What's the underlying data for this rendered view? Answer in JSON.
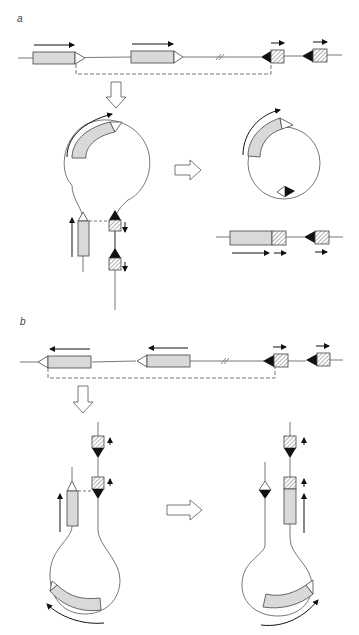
{
  "figure": {
    "panels": [
      {
        "label": "a",
        "description": "Deletion-type rearrangement: excision of intervening DNA as a circle",
        "genes": [
          "gene-segment-1",
          "gene-segment-2"
        ],
        "signal_elements": [
          "rss-element-1",
          "rss-element-2"
        ],
        "process_arrow": "down-arrow",
        "products": [
          "circular-excision-product",
          "recombined-linear-chromosome"
        ]
      },
      {
        "label": "b",
        "description": "Inversion-type rearrangement: intervening DNA inverted in chromosome",
        "genes": [
          "gene-segment-1",
          "gene-segment-2"
        ],
        "signal_elements": [
          "rss-element-1",
          "rss-element-2"
        ],
        "process_arrow": "down-arrow",
        "products": [
          "inverted-loop-product"
        ]
      }
    ],
    "colors": {
      "gene_fill": "#d9d9d9",
      "line": "#555555",
      "stroke": "#444444",
      "triangle_black": "#111111",
      "hatch": "#666666",
      "background": "#ffffff"
    }
  }
}
